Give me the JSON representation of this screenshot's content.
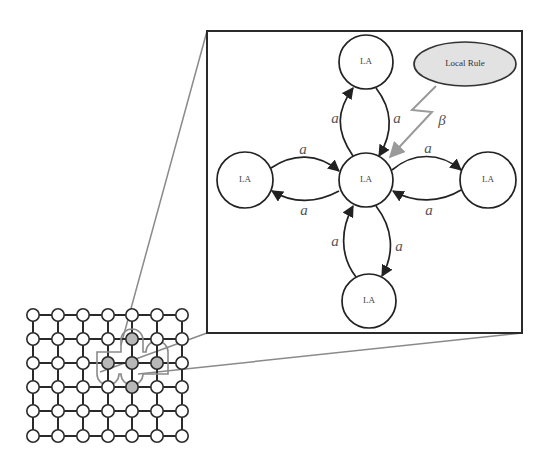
{
  "diagram": {
    "colors": {
      "stroke": "#222222",
      "highlight_node": "#b8b8b8",
      "rule_fill": "#e2e2e2",
      "connector": "#8a8a8a",
      "bolt": "#9a9a9a"
    },
    "grid": {
      "columns": 7,
      "rows": 6,
      "xs": [
        33,
        58,
        83,
        108,
        132,
        157,
        182
      ],
      "ys": [
        315,
        339,
        363,
        387,
        411,
        436
      ],
      "highlighted": [
        [
          4,
          1
        ],
        [
          3,
          2
        ],
        [
          4,
          2
        ],
        [
          5,
          2
        ],
        [
          4,
          3
        ]
      ],
      "center": [
        4,
        2
      ]
    },
    "zoom_box": {
      "x": 207,
      "y": 31,
      "width": 315,
      "height": 302
    },
    "nodes": [
      {
        "id": "center",
        "label": "LA",
        "cx": 366,
        "cy": 180,
        "r": 27
      },
      {
        "id": "top",
        "label": "LA",
        "cx": 366,
        "cy": 62,
        "r": 27
      },
      {
        "id": "left",
        "label": "LA",
        "cx": 245,
        "cy": 180,
        "r": 28
      },
      {
        "id": "right",
        "label": "LA",
        "cx": 488,
        "cy": 180,
        "r": 28
      },
      {
        "id": "bottom",
        "label": "LA",
        "cx": 369,
        "cy": 301,
        "r": 27
      }
    ],
    "local_rule": {
      "label": "Local Rule",
      "cx": 465,
      "cy": 64,
      "rx": 51,
      "ry": 22
    },
    "edge_labels": [
      {
        "text": "a",
        "x": 335,
        "y": 120
      },
      {
        "text": "a",
        "x": 397,
        "y": 120
      },
      {
        "text": "a",
        "x": 303,
        "y": 151
      },
      {
        "text": "a",
        "x": 304,
        "y": 212
      },
      {
        "text": "a",
        "x": 428,
        "y": 150
      },
      {
        "text": "a",
        "x": 429,
        "y": 212
      },
      {
        "text": "a",
        "x": 335,
        "y": 243
      },
      {
        "text": "a",
        "x": 399,
        "y": 248
      }
    ],
    "beta_label": {
      "text": "β",
      "x": 442,
      "y": 122
    }
  }
}
